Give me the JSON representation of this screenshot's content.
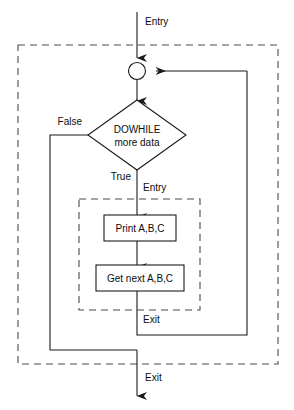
{
  "diagram": {
    "kind": "flowchart",
    "colors": {
      "line": "#1a1a1a",
      "dashed": "#4a4a4a",
      "fill": "#ffffff",
      "text": "#0d0d0d",
      "background": "#ffffff"
    },
    "nodes": {
      "junction": {
        "name": "loop-junction",
        "shape": "circle",
        "label": ""
      },
      "decision": {
        "name": "dowhile-decision",
        "shape": "diamond",
        "line1": "DOWHILE",
        "line2": "more data"
      },
      "print_box": {
        "name": "print-process",
        "shape": "rectangle",
        "label": "Print A,B,C"
      },
      "getnext_box": {
        "name": "get-next-process",
        "shape": "rectangle",
        "label": "Get next A,B,C"
      }
    },
    "labels": {
      "outer_entry": "Entry",
      "outer_exit": "Exit",
      "inner_entry": "Entry",
      "inner_exit": "Exit",
      "branch_false": "False",
      "branch_true": "True"
    },
    "groups": {
      "outer_block": {
        "name": "outer-dowhile-block",
        "style": "dashed"
      },
      "inner_block": {
        "name": "inner-loop-body-block",
        "style": "dashed"
      }
    }
  }
}
